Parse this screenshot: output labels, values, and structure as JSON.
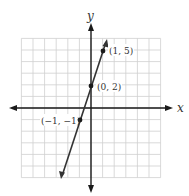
{
  "chart_data": {
    "type": "line",
    "title": "",
    "xlabel": "x",
    "ylabel": "y",
    "xlim": [
      -6,
      6
    ],
    "ylim": [
      -6,
      6
    ],
    "grid": true,
    "legend": null,
    "series": [
      {
        "name": "y = 3x + 2",
        "x": [
          -1,
          0,
          1
        ],
        "y": [
          -1,
          2,
          5
        ],
        "labeled_points": [
          {
            "x": -1,
            "y": -1,
            "label": "(−1, −1)"
          },
          {
            "x": 0,
            "y": 2,
            "label": "(0, 2)"
          },
          {
            "x": 1,
            "y": 5,
            "label": "(1, 5)"
          }
        ]
      }
    ]
  },
  "labels": {
    "x_axis": "x",
    "y_axis": "y",
    "p1": "(1, 5)",
    "p2": "(0, 2)",
    "p3": "(−1, −1)"
  },
  "colors": {
    "grid": "#cfcfcf",
    "axis": "#1a1a1a",
    "line": "#333333",
    "text": "#333333"
  }
}
